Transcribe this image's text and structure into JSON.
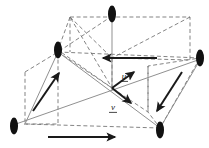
{
  "figure": {
    "background": "#ffffff",
    "width": 209,
    "height": 148,
    "colors": {
      "thin_gray": "#8a8a8a",
      "dashed_gray": "#6e6e6e",
      "thick_black": "#1a1a1a",
      "node_fill": "#111111"
    },
    "labels": [
      {
        "id": "u",
        "text": "u",
        "x": 124,
        "y": 79,
        "underline": true
      },
      {
        "id": "v",
        "text": "v",
        "x": 113,
        "y": 110,
        "underline": true
      }
    ],
    "nodes": [
      {
        "id": "top",
        "cx": 112,
        "cy": 14,
        "rx": 4.0,
        "ry": 8.5
      },
      {
        "id": "left-upper",
        "cx": 58,
        "cy": 50,
        "rx": 4.0,
        "ry": 8.5
      },
      {
        "id": "right-upper",
        "cx": 200,
        "cy": 58,
        "rx": 4.0,
        "ry": 8.5
      },
      {
        "id": "left-lower",
        "cx": 14,
        "cy": 126,
        "rx": 4.0,
        "ry": 8.5
      },
      {
        "id": "right-lower",
        "cx": 160,
        "cy": 130,
        "rx": 4.0,
        "ry": 8.5
      }
    ],
    "vectors": [
      {
        "id": "u-vector",
        "x1": 112,
        "y1": 88,
        "x2": 136,
        "y2": 71,
        "style": "thick"
      },
      {
        "id": "v-vector",
        "x1": 112,
        "y1": 88,
        "x2": 132,
        "y2": 104,
        "style": "thick"
      },
      {
        "id": "left-parallelogram-arrow",
        "x1": 33,
        "y1": 111,
        "x2": 60,
        "y2": 72,
        "style": "thick"
      },
      {
        "id": "right-parallelogram-arrow",
        "x1": 182,
        "y1": 72,
        "x2": 156,
        "y2": 112,
        "style": "thick"
      },
      {
        "id": "top-horizontal-arrow",
        "x1": 157,
        "y1": 58,
        "x2": 102,
        "y2": 58,
        "style": "thick"
      },
      {
        "id": "bottom-horizontal-arrow",
        "x1": 48,
        "y1": 137,
        "x2": 116,
        "y2": 137,
        "style": "thick"
      }
    ],
    "solid_lines": [
      {
        "id": "axis-vertical",
        "x1": 112,
        "y1": 16,
        "x2": 112,
        "y2": 90
      },
      {
        "id": "diag-left-upper-to-right-lower",
        "x1": 58,
        "y1": 52,
        "x2": 160,
        "y2": 128
      },
      {
        "id": "diag-left-lower-to-right-upper",
        "x1": 16,
        "y1": 124,
        "x2": 198,
        "y2": 60
      }
    ],
    "dashed_shapes": [
      {
        "id": "upper-left-triangle",
        "points": "70,17 58,50 112,88 70,17"
      },
      {
        "id": "upper-right-quad",
        "points": "70,17 190,17 190,60 112,58"
      },
      {
        "id": "mid-horizontal-dash",
        "points": "58,52 200,58"
      },
      {
        "id": "left-parallelogram",
        "points": "25,72 58,52 58,124 25,124 25,72"
      },
      {
        "id": "right-parallelogram",
        "points": "200,58 160,128 148,112 148,66"
      },
      {
        "id": "bottom-dash",
        "points": "24,124 160,128"
      },
      {
        "id": "center-box-left",
        "points": "112,58 112,88"
      },
      {
        "id": "inner-diag-a",
        "points": "58,52 148,112"
      },
      {
        "id": "inner-diag-b",
        "points": "112,16 58,52"
      }
    ]
  }
}
